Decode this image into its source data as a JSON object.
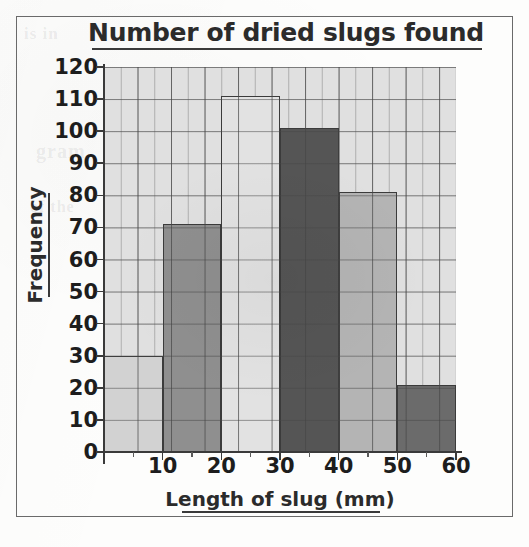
{
  "chart_data": {
    "type": "bar",
    "title": "Number of dried slugs found",
    "xlabel": "Length of slug (mm)",
    "ylabel": "Frequency",
    "categories": [
      "0-10",
      "10-20",
      "20-30",
      "30-40",
      "40-50",
      "50-60"
    ],
    "bin_edges": [
      0,
      10,
      20,
      30,
      40,
      50,
      60
    ],
    "values": [
      30,
      71,
      111,
      101,
      81,
      21
    ],
    "bar_colors": [
      "#d2d2d2",
      "#8f8f8f",
      "#e2e2e2",
      "#555555",
      "#b4b4b4",
      "#6b6b6b"
    ],
    "xlim": [
      0,
      60
    ],
    "ylim": [
      0,
      120
    ],
    "y_ticks": [
      0,
      10,
      20,
      30,
      40,
      50,
      60,
      70,
      80,
      90,
      100,
      110,
      120
    ],
    "x_ticks": [
      0,
      10,
      20,
      30,
      40,
      50,
      60
    ],
    "grid": true,
    "grid_minor": true,
    "legend": "none",
    "plot_background": "#e0e0e0"
  },
  "bleed_text": {
    "line_1": "is in",
    "line_2": "gram",
    "line_3": "of the"
  }
}
